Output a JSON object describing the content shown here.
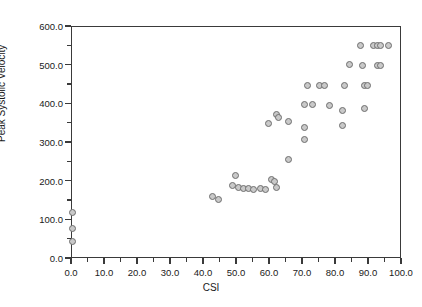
{
  "chart_data": {
    "type": "scatter",
    "title": "",
    "xlabel": "CSI",
    "ylabel": "Peak Systolic Velocity",
    "xlim": [
      0,
      100
    ],
    "ylim": [
      0,
      600
    ],
    "grid": false,
    "legend": "none",
    "xticks": [
      "0.0",
      "10.0",
      "20.0",
      "30.0",
      "40.0",
      "50.0",
      "60.0",
      "70.0",
      "80.0",
      "90.0",
      "100.0"
    ],
    "xtick_values": [
      0,
      10,
      20,
      30,
      40,
      50,
      60,
      70,
      80,
      90,
      100
    ],
    "xminor_values": [
      5,
      15,
      25,
      35,
      45,
      55,
      65,
      75,
      85,
      95
    ],
    "yticks": [
      "0.0",
      "100.0",
      "200.0",
      "300.0",
      "400.0",
      "500.0",
      "600.0"
    ],
    "ytick_values": [
      0,
      100,
      200,
      300,
      400,
      500,
      600
    ],
    "yminor_values": [
      50,
      150,
      250,
      350,
      450,
      550
    ],
    "marker": {
      "shape": "circle",
      "fill": "#c9c9c9",
      "edge": "#6e6e6e",
      "size_px": 7
    },
    "points": [
      {
        "x": 0.0,
        "y": 120
      },
      {
        "x": 0.0,
        "y": 80
      },
      {
        "x": 0.0,
        "y": 45
      },
      {
        "x": 42.5,
        "y": 162
      },
      {
        "x": 44.5,
        "y": 155
      },
      {
        "x": 48.5,
        "y": 190
      },
      {
        "x": 49.5,
        "y": 215
      },
      {
        "x": 50.5,
        "y": 185
      },
      {
        "x": 52.0,
        "y": 183
      },
      {
        "x": 53.5,
        "y": 183
      },
      {
        "x": 55.0,
        "y": 180
      },
      {
        "x": 57.0,
        "y": 182
      },
      {
        "x": 58.5,
        "y": 180
      },
      {
        "x": 60.5,
        "y": 205
      },
      {
        "x": 61.5,
        "y": 200
      },
      {
        "x": 62.0,
        "y": 185
      },
      {
        "x": 65.5,
        "y": 258
      },
      {
        "x": 59.5,
        "y": 350
      },
      {
        "x": 62.0,
        "y": 375
      },
      {
        "x": 62.5,
        "y": 365
      },
      {
        "x": 65.5,
        "y": 355
      },
      {
        "x": 70.5,
        "y": 400
      },
      {
        "x": 70.5,
        "y": 340
      },
      {
        "x": 70.5,
        "y": 310
      },
      {
        "x": 73.0,
        "y": 400
      },
      {
        "x": 71.5,
        "y": 450
      },
      {
        "x": 75.0,
        "y": 450
      },
      {
        "x": 76.5,
        "y": 450
      },
      {
        "x": 78.0,
        "y": 398
      },
      {
        "x": 82.0,
        "y": 385
      },
      {
        "x": 82.0,
        "y": 345
      },
      {
        "x": 82.5,
        "y": 450
      },
      {
        "x": 84.0,
        "y": 502
      },
      {
        "x": 87.5,
        "y": 552
      },
      {
        "x": 88.0,
        "y": 500
      },
      {
        "x": 88.5,
        "y": 450
      },
      {
        "x": 89.5,
        "y": 450
      },
      {
        "x": 88.5,
        "y": 390
      },
      {
        "x": 91.5,
        "y": 552
      },
      {
        "x": 92.5,
        "y": 552
      },
      {
        "x": 93.5,
        "y": 552
      },
      {
        "x": 92.5,
        "y": 500
      },
      {
        "x": 93.5,
        "y": 500
      },
      {
        "x": 96.0,
        "y": 552
      }
    ]
  }
}
